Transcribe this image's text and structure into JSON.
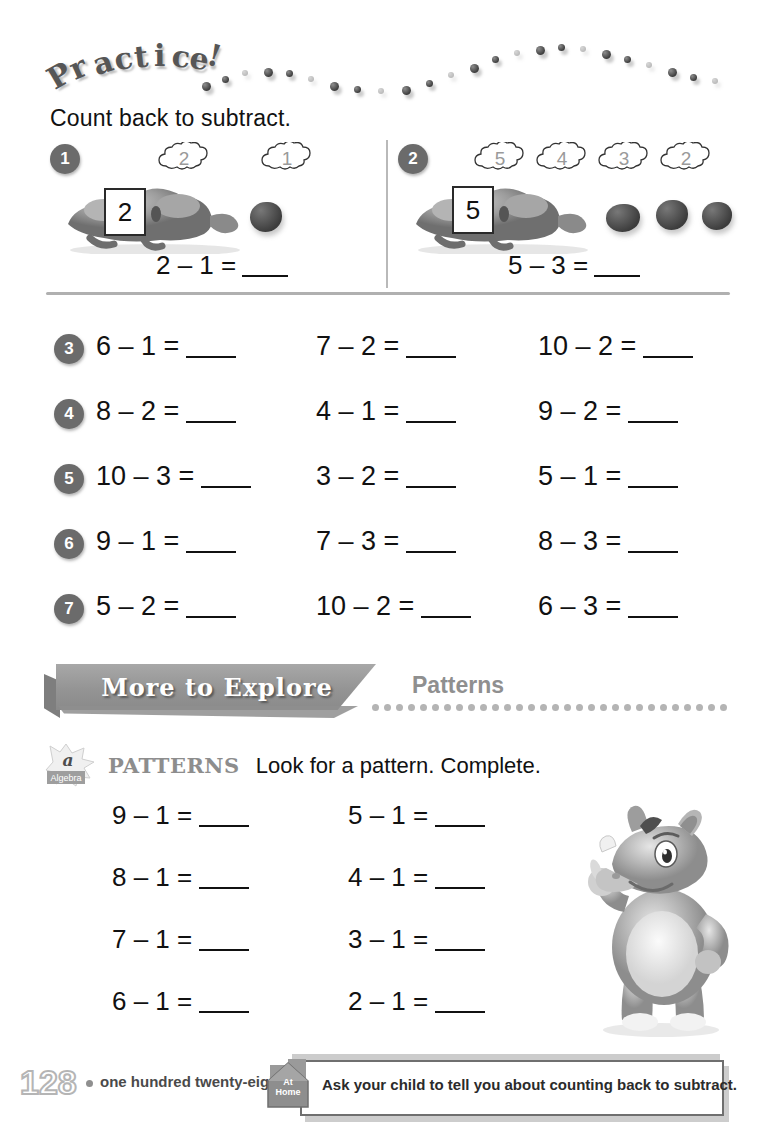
{
  "header": {
    "practice_title": "Practice!",
    "instruction": "Count back to subtract."
  },
  "models": [
    {
      "number": "1",
      "clouds": [
        "2",
        "1"
      ],
      "start_number": "2",
      "equation_left": "2 – 1 =",
      "bean_count": 1
    },
    {
      "number": "2",
      "clouds": [
        "5",
        "4",
        "3",
        "2"
      ],
      "start_number": "5",
      "equation_left": "5 – 3 =",
      "bean_count": 3
    }
  ],
  "problems": [
    {
      "number": "3",
      "items": [
        "6 – 1 =",
        "7 – 2 =",
        "10 – 2 ="
      ]
    },
    {
      "number": "4",
      "items": [
        "8 – 2 =",
        "4 – 1 =",
        "9 – 2 ="
      ]
    },
    {
      "number": "5",
      "items": [
        "10 – 3 =",
        "3 – 2 =",
        "5 – 1 ="
      ]
    },
    {
      "number": "6",
      "items": [
        "9 – 1 =",
        "7 – 3 =",
        "8 – 3 ="
      ]
    },
    {
      "number": "7",
      "items": [
        "5 – 2 =",
        "10 – 2 =",
        "6 – 3 ="
      ]
    }
  ],
  "explore": {
    "banner_label": "More to Explore",
    "subtitle": "Patterns"
  },
  "algebra_icon": {
    "letter": "a",
    "label": "Algebra"
  },
  "patterns": {
    "keyword": "PATTERNS",
    "instruction": "Look for a pattern. Complete.",
    "rows": [
      {
        "left": "9 – 1 =",
        "right": "5 – 1 ="
      },
      {
        "left": "8 – 1 =",
        "right": "4 – 1 ="
      },
      {
        "left": "7 – 1 =",
        "right": "3 – 1 ="
      },
      {
        "left": "6 – 1 =",
        "right": "2 – 1 ="
      }
    ]
  },
  "footer": {
    "page_number": "128",
    "page_words": "one hundred twenty-eight",
    "athome_line1": "At",
    "athome_line2": "Home",
    "athome_message": "Ask your child to tell you about counting back to subtract."
  },
  "colors": {
    "badge": "#6b6b6b",
    "banner": "#949494",
    "rule": "#b0b0b0",
    "muted_text": "#8f8f8f"
  }
}
